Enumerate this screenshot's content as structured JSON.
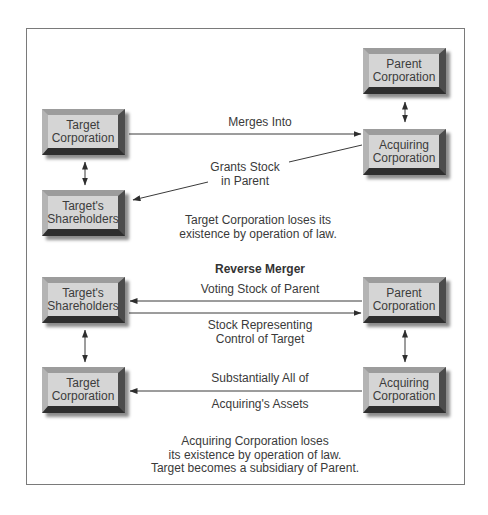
{
  "diagram": {
    "type": "flow",
    "top_section": {
      "boxes": {
        "parent": "Parent\nCorporation",
        "acquiring": "Acquiring\nCorporation",
        "target": "Target\nCorporation",
        "shareholders": "Target's\nShareholders"
      },
      "edges": [
        {
          "from": "Target Corporation",
          "to": "Acquiring Corporation",
          "label": "Merges Into",
          "direction": "forward"
        },
        {
          "from": "Acquiring Corporation",
          "to": "Target's Shareholders",
          "label": "Grants Stock\nin Parent",
          "direction": "forward"
        },
        {
          "from": "Parent Corporation",
          "to": "Acquiring Corporation",
          "label": "",
          "direction": "both"
        },
        {
          "from": "Target Corporation",
          "to": "Target's Shareholders",
          "label": "",
          "direction": "both"
        }
      ],
      "labels": {
        "merges_into": "Merges Into",
        "grants_stock": "Grants Stock\nin Parent"
      },
      "note": "Target Corporation loses its\nexistence by operation of law."
    },
    "bottom_section": {
      "title": "Reverse Merger",
      "boxes": {
        "shareholders": "Target's\nShareholders",
        "parent": "Parent\nCorporation",
        "target": "Target\nCorporation",
        "acquiring": "Acquiring\nCorporation"
      },
      "edges": [
        {
          "from": "Parent Corporation",
          "to": "Target's Shareholders",
          "label": "Voting Stock of Parent",
          "direction": "forward"
        },
        {
          "from": "Target's Shareholders",
          "to": "Parent Corporation",
          "label": "Stock Representing\nControl of Target",
          "direction": "forward"
        },
        {
          "from": "Acquiring Corporation",
          "to": "Target Corporation",
          "label": "Substantially All of\nAcquiring's Assets",
          "direction": "forward"
        },
        {
          "from": "Target's Shareholders",
          "to": "Target Corporation",
          "label": "",
          "direction": "both"
        },
        {
          "from": "Parent Corporation",
          "to": "Acquiring Corporation",
          "label": "",
          "direction": "both"
        }
      ],
      "labels": {
        "voting_stock": "Voting Stock of Parent",
        "stock_representing": "Stock Representing\nControl of Target",
        "substantially_all": "Substantially All of",
        "acquirings_assets": "Acquiring's Assets"
      },
      "note": "Acquiring Corporation loses\nits existence by operation of law.\nTarget becomes a subsidiary of Parent."
    },
    "colors": {
      "box_face": "#d5d5d5",
      "bevel_top": "#9c9c9c",
      "bevel_left": "#b4b4b4",
      "bevel_right": "#4c4c4c",
      "bevel_bottom": "#2e2e2e",
      "line": "#3a3a3a",
      "frame": "#7a7a7a",
      "text": "#3a3a3a"
    }
  }
}
